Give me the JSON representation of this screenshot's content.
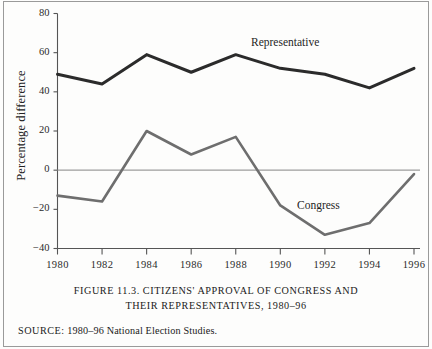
{
  "figure": {
    "caption_line1": "FIGURE 11.3. CITIZENS' APPROVAL OF CONGRESS AND",
    "caption_line2": "THEIR REPRESENTATIVES, 1980–96",
    "source_label": "SOURCE:",
    "source_text": " 1980–96 National Election Studies."
  },
  "colors": {
    "representative_line": "#2b2b2b",
    "congress_line": "#6e6e6e",
    "axis": "#555555",
    "zero_line": "#9d9d9d",
    "frame": "#9a9a9a",
    "background": "#fdfdfc"
  },
  "chart_data": {
    "type": "line",
    "title": "FIGURE 11.3. CITIZENS' APPROVAL OF CONGRESS AND THEIR REPRESENTATIVES, 1980–96",
    "xlabel": "",
    "ylabel": "Percentage difference",
    "x": [
      1980,
      1982,
      1984,
      1986,
      1988,
      1990,
      1992,
      1994,
      1996
    ],
    "xtick_labels": [
      "1980",
      "1982",
      "1984",
      "1986",
      "1988",
      "1990",
      "1992",
      "1994",
      "1996"
    ],
    "ytick_labels": [
      "80",
      "60",
      "40",
      "20",
      "0",
      "−20",
      "−40"
    ],
    "yticks": [
      80,
      60,
      40,
      20,
      0,
      -20,
      -40
    ],
    "ylim": [
      -40,
      80
    ],
    "xlim": [
      1980,
      1996
    ],
    "grid": false,
    "legend": "inline-labels",
    "zero_reference_line": 0,
    "series": [
      {
        "name": "Representative",
        "label_position": "above-right",
        "values": [
          49,
          44,
          59,
          50,
          59,
          52,
          49,
          42,
          52
        ]
      },
      {
        "name": "Congress",
        "label_position": "inline-lower-right",
        "values": [
          -13,
          -16,
          20,
          8,
          17,
          -18,
          -33,
          -27,
          -2
        ]
      }
    ]
  }
}
